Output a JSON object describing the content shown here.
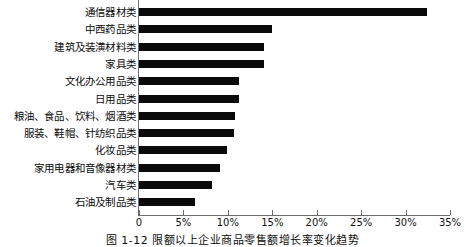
{
  "chart_data": {
    "type": "bar",
    "orientation": "horizontal",
    "title": "",
    "xlabel": "",
    "ylabel": "",
    "xlim": [
      0,
      35
    ],
    "xticks": [
      0,
      5,
      10,
      15,
      20,
      25,
      30,
      35
    ],
    "xtick_labels": [
      "0",
      "5%",
      "10%",
      "15%",
      "20%",
      "25%",
      "30%",
      "35%"
    ],
    "grid": false,
    "legend": null,
    "bar_color": "#0a0a0a",
    "axis_color": "#6d6d6d",
    "categories": [
      "通信器材类",
      "中西药品类",
      "建筑及装潢材料类",
      "家具类",
      "文化办公用品类",
      "日用品类",
      "粮油、食品、饮料、烟酒类",
      "服装、鞋帽、针纺织品类",
      "化妆品类",
      "家用电器和音像器材类",
      "汽车类",
      "石油及制品类"
    ],
    "values": [
      32.4,
      15.0,
      14.1,
      14.1,
      11.2,
      11.2,
      10.8,
      10.7,
      9.9,
      9.1,
      8.2,
      6.3
    ]
  },
  "caption": {
    "text": "图 1-12  限额以上企业商品零售额增长率变化趋势"
  }
}
